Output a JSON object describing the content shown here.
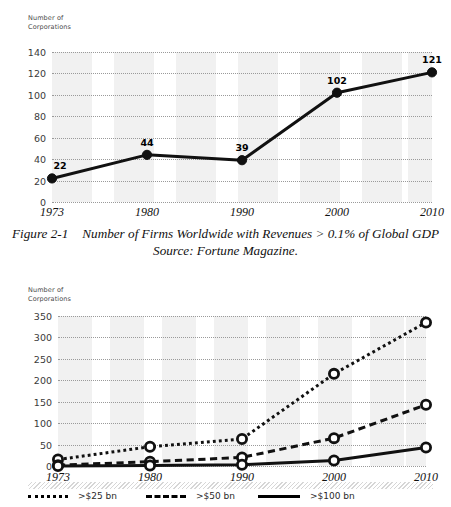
{
  "caption": {
    "figure_number": "Figure 2-1",
    "title": "Number of Firms Worldwide with Revenues > 0.1% of Global GDP",
    "source": "Source: Fortune Magazine."
  },
  "chart_data": [
    {
      "id": "top",
      "type": "line",
      "title": "",
      "xlabel": "",
      "ylabel": "Number of\nCorporations",
      "categories": [
        "1973",
        "1980",
        "1990",
        "2000",
        "2010"
      ],
      "values": [
        22,
        44,
        39,
        102,
        121
      ],
      "data_labels": [
        "22",
        "44",
        "39",
        "102",
        "121"
      ],
      "yticks": [
        0,
        20,
        40,
        60,
        80,
        100,
        120,
        140
      ],
      "ytick_labels": [
        "0",
        "20",
        "40",
        "60",
        "80",
        "100",
        "120",
        "140"
      ],
      "ylim": [
        0,
        140
      ],
      "grid": true,
      "legend": null,
      "series_style": "solid",
      "marker": "circle-filled",
      "line_color": "#111111"
    },
    {
      "id": "bottom",
      "type": "line",
      "title": "",
      "xlabel": "",
      "ylabel": "Number of\nCorporations",
      "categories": [
        "1973",
        "1980",
        "1990",
        "2000",
        "2010"
      ],
      "series": [
        {
          "name": ">$25 bn",
          "style": "dotted",
          "values": [
            15,
            45,
            63,
            215,
            335
          ]
        },
        {
          "name": ">$50 bn",
          "style": "dashed",
          "values": [
            2,
            10,
            20,
            65,
            143
          ]
        },
        {
          "name": ">$100 bn",
          "style": "solid",
          "values": [
            0,
            1,
            3,
            13,
            43
          ]
        }
      ],
      "yticks": [
        0,
        50,
        100,
        150,
        200,
        250,
        300,
        350
      ],
      "ytick_labels": [
        "0",
        "50",
        "100",
        "150",
        "200",
        "250",
        "300",
        "350"
      ],
      "ylim": [
        0,
        350
      ],
      "grid": true,
      "legend_position": "bottom",
      "marker": "circle-open",
      "line_color": "#111111"
    }
  ]
}
